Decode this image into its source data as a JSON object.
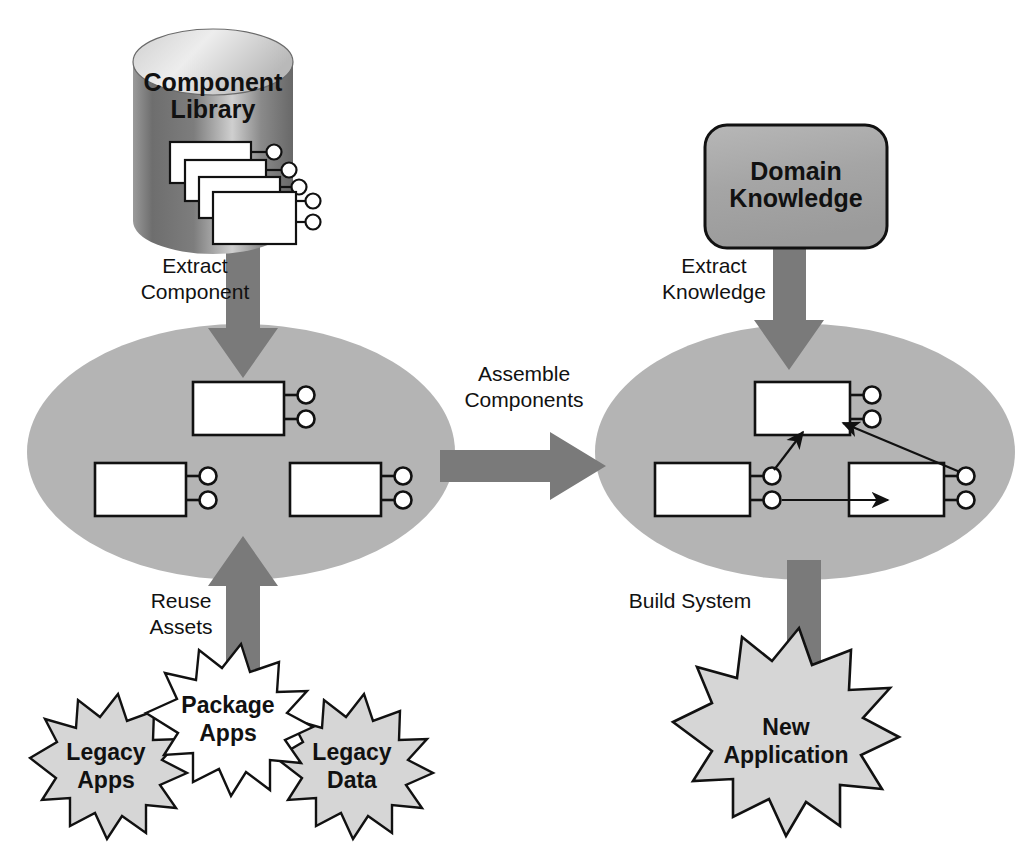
{
  "diagram": {
    "type": "process-flow-diagram",
    "background_color": "#ffffff"
  },
  "colors": {
    "arrow_gray": "#7a7a7a",
    "ellipse_gray": "#b4b4b4",
    "box_gray": "#a8a8a8",
    "burst_gray": "#d6d6d6",
    "burst_white": "#ffffff",
    "stroke_black": "#111111",
    "component_fill": "#ffffff",
    "cylinder_light": "#e8e8e8",
    "cylinder_dark": "#6e6e6e"
  },
  "nodes": {
    "component_library": {
      "label_line1": "Component",
      "label_line2": "Library",
      "shape": "cylinder",
      "components_count": 4
    },
    "domain_knowledge": {
      "label_line1": "Domain",
      "label_line2": "Knowledge",
      "shape": "rounded-rectangle"
    },
    "component_pool": {
      "shape": "ellipse",
      "components_count": 3
    },
    "assembled_system": {
      "shape": "ellipse",
      "components_count": 3
    },
    "legacy_apps": {
      "label_line1": "Legacy",
      "label_line2": "Apps",
      "shape": "starburst",
      "fill": "#d6d6d6"
    },
    "package_apps": {
      "label_line1": "Package",
      "label_line2": "Apps",
      "shape": "starburst",
      "fill": "#ffffff"
    },
    "legacy_data": {
      "label_line1": "Legacy",
      "label_line2": "Data",
      "shape": "starburst",
      "fill": "#d6d6d6"
    },
    "new_application": {
      "label_line1": "New",
      "label_line2": "Application",
      "shape": "starburst",
      "fill": "#d6d6d6"
    }
  },
  "flows": {
    "extract_component": {
      "label_line1": "Extract",
      "label_line2": "Component",
      "direction": "down",
      "from": "component_library",
      "to": "component_pool"
    },
    "extract_knowledge": {
      "label_line1": "Extract",
      "label_line2": "Knowledge",
      "direction": "down",
      "from": "domain_knowledge",
      "to": "assembled_system"
    },
    "assemble_components": {
      "label_line1": "Assemble",
      "label_line2": "Components",
      "direction": "right",
      "from": "component_pool",
      "to": "assembled_system"
    },
    "reuse_assets": {
      "label_line1": "Reuse",
      "label_line2": "Assets",
      "direction": "up",
      "from": "package_apps",
      "to": "component_pool"
    },
    "build_system": {
      "label_line1": "Build System",
      "label_line2": "",
      "direction": "down",
      "from": "assembled_system",
      "to": "new_application"
    }
  }
}
